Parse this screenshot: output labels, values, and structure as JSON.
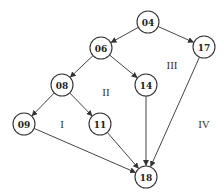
{
  "diagram": {
    "type": "directed-graph",
    "nodes": [
      {
        "id": "04",
        "label": "04"
      },
      {
        "id": "06",
        "label": "06"
      },
      {
        "id": "17",
        "label": "17"
      },
      {
        "id": "08",
        "label": "08"
      },
      {
        "id": "14",
        "label": "14"
      },
      {
        "id": "09",
        "label": "09"
      },
      {
        "id": "11",
        "label": "11"
      },
      {
        "id": "18",
        "label": "18"
      }
    ],
    "edges": [
      {
        "from": "04",
        "to": "06"
      },
      {
        "from": "04",
        "to": "17"
      },
      {
        "from": "06",
        "to": "08"
      },
      {
        "from": "06",
        "to": "14"
      },
      {
        "from": "08",
        "to": "09"
      },
      {
        "from": "08",
        "to": "11"
      },
      {
        "from": "09",
        "to": "18"
      },
      {
        "from": "11",
        "to": "18"
      },
      {
        "from": "14",
        "to": "18"
      },
      {
        "from": "17",
        "to": "18"
      }
    ],
    "regions": [
      {
        "id": "I",
        "label": "I"
      },
      {
        "id": "II",
        "label": "II"
      },
      {
        "id": "III",
        "label": "III"
      },
      {
        "id": "IV",
        "label": "IV"
      }
    ]
  }
}
